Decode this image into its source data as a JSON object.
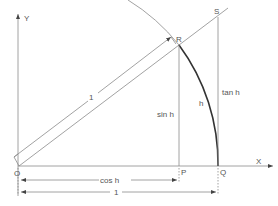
{
  "figure": {
    "axes": {
      "x_label": "X",
      "y_label": "Y",
      "origin_label": "O"
    },
    "points": {
      "R": "R",
      "S": "S",
      "P": "P",
      "Q": "Q"
    },
    "labels": {
      "radius": "1",
      "sin": "sin h",
      "tan": "tan h",
      "arc": "h",
      "cos": "cos h",
      "unit": "1"
    },
    "colors": {
      "line": "#8a8a8a",
      "arc": "#333333",
      "text": "#555555",
      "background": "#ffffff"
    }
  }
}
